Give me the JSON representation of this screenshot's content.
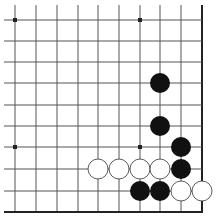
{
  "board": {
    "description": "Go problem diagram, lower-right corner",
    "colors": {
      "background": "#ffffff",
      "line": "#555555",
      "edge": "#222222",
      "black": "#111111",
      "white": "#ffffff",
      "white_outline": "#333333"
    },
    "grid": {
      "cols": 10,
      "rows": 10,
      "x": [
        15,
        36,
        57,
        78,
        98,
        119,
        140,
        160,
        181,
        202
      ],
      "y": [
        20,
        41,
        62,
        83,
        105,
        126,
        147,
        169,
        191,
        212
      ],
      "extend_left_to": 4,
      "extend_top_to": 5,
      "right_edge": true,
      "bottom_edge": true
    },
    "star_points": [
      [
        0,
        0
      ],
      [
        6,
        0
      ],
      [
        0,
        6
      ],
      [
        6,
        6
      ]
    ],
    "stone_radius": 10,
    "stones": {
      "black": [
        [
          7,
          3
        ],
        [
          7,
          5
        ],
        [
          8,
          6
        ],
        [
          8,
          7
        ],
        [
          6,
          8
        ],
        [
          7,
          8
        ]
      ],
      "white": [
        [
          4,
          7
        ],
        [
          5,
          7
        ],
        [
          6,
          7
        ],
        [
          7,
          7
        ],
        [
          8,
          8
        ],
        [
          9,
          8
        ]
      ]
    }
  }
}
